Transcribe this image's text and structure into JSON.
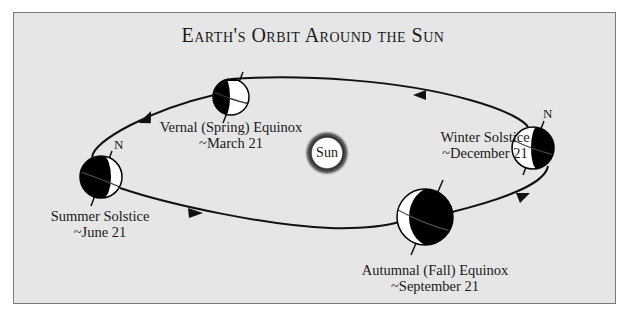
{
  "title": "Earth's Orbit Around the Sun",
  "sun": {
    "label": "Sun"
  },
  "positions": [
    {
      "id": "vernal",
      "name": "Vernal (Spring) Equinox",
      "date": "~March 21",
      "north_label": ""
    },
    {
      "id": "summer",
      "name": "Summer Solstice",
      "date": "~June 21",
      "north_label": "N"
    },
    {
      "id": "autumnal",
      "name": "Autumnal (Fall) Equinox",
      "date": "~September 21",
      "north_label": ""
    },
    {
      "id": "winter",
      "name": "Winter Solstice",
      "date": "~December 21",
      "north_label": "N"
    }
  ],
  "colors": {
    "background": "#e6e6e6",
    "border": "#7a7a7a",
    "orbit": "#111111",
    "earth_dark": "#000000",
    "earth_light": "#ffffff"
  }
}
